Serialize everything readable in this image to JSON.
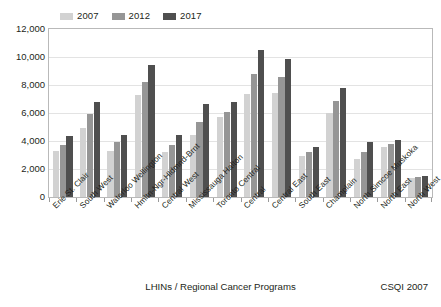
{
  "chart_data": {
    "type": "bar",
    "title": "",
    "subtitle": "",
    "xlabel": "LHINs / Regional Cancer Programs",
    "ylabel": "",
    "ylim": [
      0,
      12000
    ],
    "ytick_step": 2000,
    "ytick_labels": [
      "12,000",
      "10,000",
      "8,000",
      "6,000",
      "4,000",
      "2,000",
      "0"
    ],
    "grid": true,
    "legend_position": "top-left",
    "categories": [
      "Erie St. Clair",
      "South West",
      "Waterloo Wellington",
      "Hmltn-Ngr-Hldmnd-Brnt",
      "Central West",
      "Mississauga Halton",
      "Toronto Central",
      "Central",
      "Central East",
      "South East",
      "Champlain",
      "North Simcoe Muskoka",
      "North East",
      "North West"
    ],
    "series": [
      {
        "name": "2007",
        "color": "#d2d2d2",
        "values": [
          3300,
          4950,
          3300,
          7300,
          3200,
          4400,
          5750,
          7350,
          7400,
          2900,
          6000,
          2700,
          3600,
          1350
        ]
      },
      {
        "name": "2012",
        "color": "#969696",
        "values": [
          3750,
          5900,
          3900,
          8250,
          3700,
          5350,
          6100,
          8800,
          8550,
          3200,
          6850,
          3250,
          3800,
          1400
        ]
      },
      {
        "name": "2017",
        "color": "#4f4f4f",
        "values": [
          4350,
          6800,
          4450,
          9400,
          4450,
          6650,
          6800,
          10500,
          9850,
          3550,
          7800,
          3900,
          4100,
          1500
        ]
      }
    ],
    "source_note": "CSQI 2007"
  },
  "legend": {
    "items": [
      {
        "label": "2007",
        "color": "#d2d2d2"
      },
      {
        "label": "2012",
        "color": "#969696"
      },
      {
        "label": "2017",
        "color": "#4f4f4f"
      }
    ]
  },
  "footer": {
    "axis_title": "LHINs / Regional Cancer Programs",
    "source": "CSQI 2007"
  }
}
